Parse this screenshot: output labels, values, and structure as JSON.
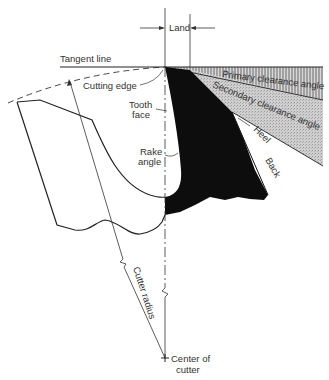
{
  "figure": {
    "type": "milling cutter tooth nomenclature",
    "colors": {
      "tooth_fill": "#0d0d0d",
      "primary_hatch": "#8a8a8a",
      "secondary_fill": "#c9c9c9",
      "line": "#222222",
      "text": "#333333"
    }
  },
  "labels": {
    "land": "Land",
    "tangent_line": "Tangent line",
    "cutting_edge": "Cutting edge",
    "tooth_face_1": "Tooth",
    "tooth_face_2": "face",
    "rake_angle_1": "Rake",
    "rake_angle_2": "angle",
    "primary_clearance": "Primary clearance angle",
    "secondary_clearance": "Secondary clearance angle",
    "heel": "Heel",
    "back": "Back",
    "cutter_radius": "Cutter radius",
    "center_1": "Center of",
    "center_2": "cutter"
  }
}
